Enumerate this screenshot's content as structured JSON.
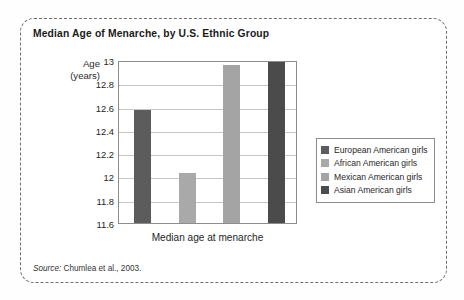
{
  "figure": {
    "title": "Median Age of Menarche, by U.S. Ethnic Group",
    "source_label": "Source:",
    "source_text": "Chumlea et al., 2003.",
    "border_color": "#6e6e6e"
  },
  "chart_data": {
    "type": "bar",
    "title": "Median Age of Menarche, by U.S. Ethnic Group",
    "xlabel": "Median age at menarche",
    "ylabel_line1": "Age",
    "ylabel_line2": "(years)",
    "ylim": [
      11.6,
      13.0
    ],
    "yticks": [
      "13",
      "12.8",
      "12.6",
      "12.4",
      "12.2",
      "12",
      "11.8",
      "11.6"
    ],
    "ytick_values": [
      13,
      12.8,
      12.6,
      12.4,
      12.2,
      12,
      11.8,
      11.6
    ],
    "grid": true,
    "legend_position": "right",
    "categories": [
      "European American girls",
      "African American girls",
      "Mexican American girls",
      "Asian American girls"
    ],
    "values": [
      12.57,
      12.03,
      12.96,
      13.0
    ],
    "colors": [
      "#5c5c5c",
      "#a9a9a9",
      "#a4a4a4",
      "#4b4b4b"
    ],
    "series": [
      {
        "name": "Median age at menarche",
        "values": [
          12.57,
          12.03,
          12.96,
          13.0
        ]
      }
    ]
  },
  "legend": {
    "items": [
      {
        "label": "European American girls",
        "color": "#5c5c5c"
      },
      {
        "label": "African American girls",
        "color": "#a9a9a9"
      },
      {
        "label": "Mexican American girls",
        "color": "#a4a4a4"
      },
      {
        "label": "Asian American girls",
        "color": "#4b4b4b"
      }
    ]
  }
}
